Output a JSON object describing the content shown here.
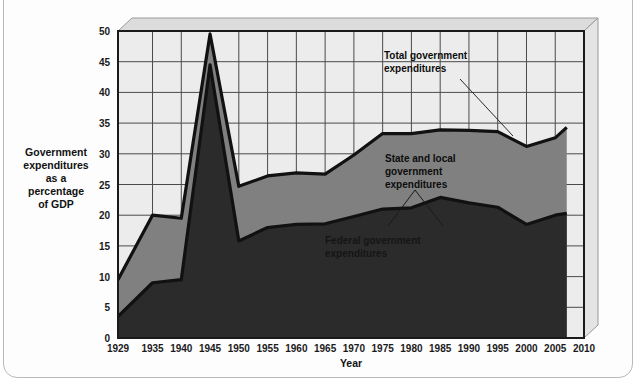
{
  "figure": {
    "background_color": "#ffffff",
    "panel_color": "#ececec",
    "frame_color": "#b9b9bd"
  },
  "chart_data": {
    "type": "area",
    "stacked": true,
    "title": "",
    "xlabel": "Year",
    "ylabel": "Government expenditures as a percentage of GDP",
    "ylabel_lines": [
      "Government",
      "expenditures",
      "as a",
      "percentage",
      "of GDP"
    ],
    "x": [
      1929,
      1935,
      1940,
      1945,
      1950,
      1955,
      1960,
      1965,
      1970,
      1975,
      1980,
      1985,
      1990,
      1995,
      2000,
      2005,
      2007
    ],
    "xticks": [
      1929,
      1935,
      1940,
      1945,
      1950,
      1955,
      1960,
      1965,
      1970,
      1975,
      1980,
      1985,
      1990,
      1995,
      2000,
      2005,
      2010
    ],
    "xtick_labels": [
      "1929",
      "1935",
      "1940",
      "1945",
      "1950",
      "1955",
      "1960",
      "1965",
      "1970",
      "1975",
      "1980",
      "1985",
      "1990",
      "1995",
      "2000",
      "2005",
      "2010"
    ],
    "yticks": [
      0,
      5,
      10,
      15,
      20,
      25,
      30,
      35,
      40,
      45,
      50
    ],
    "ytick_labels": [
      "0",
      "5",
      "10",
      "15",
      "20",
      "25",
      "30",
      "35",
      "40",
      "45",
      "50"
    ],
    "ylim": [
      0,
      50
    ],
    "xlim": [
      1929,
      2010
    ],
    "grid": true,
    "legend": "annotations",
    "series": [
      {
        "name": "Federal government expenditures",
        "color": "#2b2b2b",
        "values": [
          3.5,
          9.0,
          9.5,
          44.5,
          15.8,
          18.0,
          18.5,
          18.6,
          19.8,
          21.0,
          21.2,
          22.9,
          22.0,
          21.3,
          18.5,
          20.0,
          20.3
        ]
      },
      {
        "name": "State and local government expenditures",
        "color": "#808080",
        "values": [
          6.0,
          11.0,
          10.0,
          5.0,
          8.9,
          8.4,
          8.4,
          8.1,
          10.0,
          12.3,
          12.1,
          11.0,
          11.8,
          12.3,
          12.7,
          12.6,
          14.0
        ]
      }
    ],
    "total": {
      "name": "Total government expenditures",
      "values": [
        9.5,
        20.0,
        19.5,
        49.5,
        24.7,
        26.4,
        26.9,
        26.7,
        29.8,
        33.3,
        33.3,
        33.9,
        33.8,
        33.6,
        31.2,
        32.6,
        34.3
      ]
    }
  },
  "annotations": [
    {
      "id": "total-gov-annotation",
      "lines": [
        "Total government",
        "expenditures"
      ],
      "text_color": "#0d0d0d",
      "on_dark": false
    },
    {
      "id": "state-local-annotation",
      "lines": [
        "State and local",
        "government",
        "expenditures"
      ],
      "text_color": "#0d0d0d",
      "on_dark": false
    },
    {
      "id": "federal-annotation",
      "lines": [
        "Federal government",
        "expenditures"
      ],
      "text_color": "#151515",
      "on_dark": true
    }
  ]
}
